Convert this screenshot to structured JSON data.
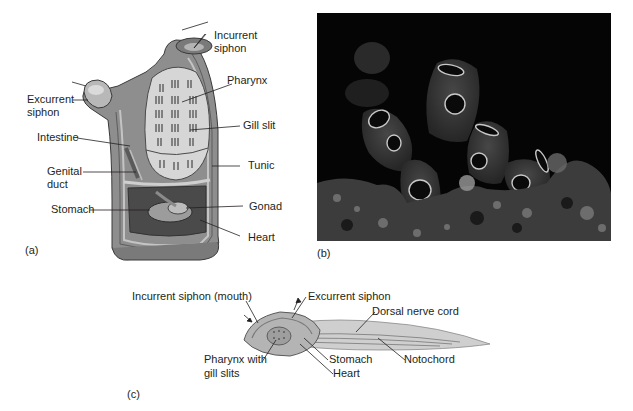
{
  "figure": {
    "panels": [
      {
        "tag": "(a)",
        "description": "Cutaway of adult sea squirt (tunicate)",
        "labels": {
          "incurrent_siphon_1": "Incurrent",
          "incurrent_siphon_2": "siphon",
          "pharynx": "Pharynx",
          "excurrent_siphon_1": "Excurrent",
          "excurrent_siphon_2": "siphon",
          "gill_slit": "Gill slit",
          "intestine": "Intestine",
          "tunic": "Tunic",
          "genital_duct_1": "Genital",
          "genital_duct_2": "duct",
          "gonad": "Gonad",
          "stomach": "Stomach",
          "heart": "Heart"
        }
      },
      {
        "tag": "(b)",
        "description": "Photograph of tunicates on reef"
      },
      {
        "tag": "(c)",
        "description": "Tunicate larva",
        "labels": {
          "incurrent_siphon_mouth": "Incurrent siphon (mouth)",
          "excurrent_siphon": "Excurrent siphon",
          "dorsal_nerve_cord": "Dorsal nerve cord",
          "pharynx_1": "Pharynx with",
          "pharynx_2": "gill slits",
          "stomach": "Stomach",
          "heart": "Heart",
          "notochord": "Notochord"
        }
      }
    ]
  },
  "colors": {
    "text": "#231f20",
    "body_gray": "#9a9a9a",
    "tunic_dark": "#6e6e6e",
    "pharynx_light": "#d8d8d8",
    "photo_bg": "#050505",
    "tunicate_body": "#3a3a3a",
    "siphon_ring": "#c8c8c8"
  }
}
